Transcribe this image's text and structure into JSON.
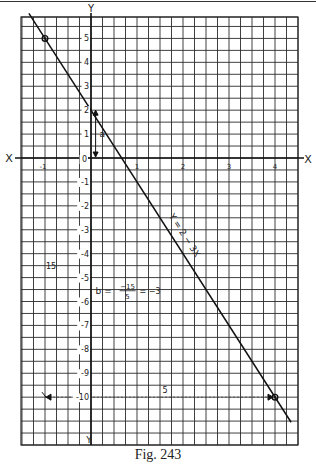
{
  "figure": {
    "caption": "Fig. 243",
    "axis_labels": {
      "x_left": "X",
      "x_right": "X",
      "y_top": "Y",
      "y_bottom": "Y"
    },
    "origin_label": "0",
    "x_tick_labels": [
      "-1",
      "1",
      "2",
      "3",
      "4"
    ],
    "y_tick_labels": [
      "5",
      "4",
      "3",
      "2",
      "1",
      "-1",
      "-2",
      "-3",
      "-4",
      "-5",
      "-6",
      "-7",
      "-8",
      "-9",
      "-10"
    ],
    "line_label": "Y = 2 − 3X",
    "slope_annotation": {
      "prefix": "b =",
      "numerator": "−15",
      "denominator": "5",
      "result": "= −3"
    },
    "intercept_label": "a",
    "rise_label": "15",
    "run_label": "5",
    "colors": {
      "ink": "#1a1a1a",
      "grid": "#2a2a2a",
      "paper": "#ffffff"
    }
  },
  "chart_data": {
    "type": "line",
    "title": "Fig. 243",
    "xlabel": "X",
    "ylabel": "Y",
    "equation": "Y = 2 - 3X",
    "intercept_a": 2,
    "slope_b": -3,
    "slope_computation": "b = -15/5 = -3",
    "series": [
      {
        "name": "Y = 2 - 3X",
        "x": [
          -1.35,
          4.35
        ],
        "y": [
          6.05,
          -11.05
        ]
      }
    ],
    "marked_points": [
      {
        "x": -1,
        "y": 5
      },
      {
        "x": 4,
        "y": -10
      }
    ],
    "rise": -15,
    "run": 5,
    "xlim": [
      -1.5,
      4.5
    ],
    "ylim": [
      -12,
      6
    ],
    "x_ticks": [
      -1,
      1,
      2,
      3,
      4
    ],
    "y_ticks": [
      5,
      4,
      3,
      2,
      1,
      -1,
      -2,
      -3,
      -4,
      -5,
      -6,
      -7,
      -8,
      -9,
      -10
    ],
    "grid": true,
    "grid_cells_per_x_unit": 4,
    "grid_cells_per_y_unit": 2
  }
}
